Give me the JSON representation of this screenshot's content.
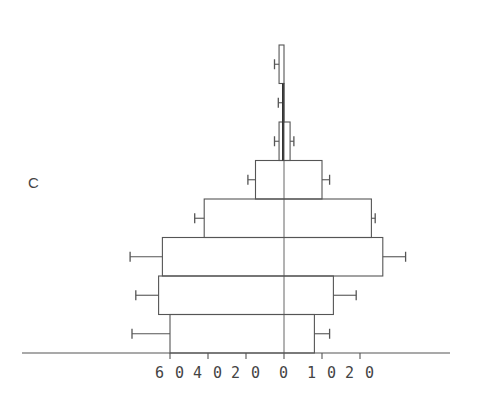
{
  "panel_label": "C",
  "chart_data": {
    "type": "bar",
    "orientation": "horizontal",
    "style": "population-pyramid",
    "title": "",
    "xlabel": "",
    "ylabel": "",
    "panel": "C",
    "grid": false,
    "legend": null,
    "left_axis": {
      "ticks": [
        60,
        40,
        20,
        0
      ],
      "tick_labels": [
        "60",
        "40",
        "20",
        "0"
      ],
      "range": [
        0,
        85
      ]
    },
    "right_axis": {
      "ticks": [
        0,
        10,
        20
      ],
      "tick_labels": [
        "0",
        "10",
        "20"
      ],
      "range": [
        0,
        40
      ]
    },
    "categories": [
      "1",
      "2",
      "3",
      "4",
      "5",
      "6",
      "7",
      "8"
    ],
    "category_order": "bottom-to-top",
    "series": [
      {
        "name": "left",
        "values": [
          60,
          66,
          64,
          42,
          15,
          2.6,
          0.5,
          2.6
        ],
        "error": [
          80,
          78,
          81,
          47,
          19,
          5,
          3,
          5
        ]
      },
      {
        "name": "right",
        "values": [
          8,
          13,
          26,
          23,
          10,
          1.6,
          0,
          0
        ],
        "error": [
          12,
          19,
          32,
          24,
          12,
          2.6,
          null,
          null
        ]
      }
    ]
  },
  "layout": {
    "center_x": 284,
    "baseline_y": 353,
    "bar_height": 38.5,
    "left_px_per_unit": 1.9,
    "right_px_per_unit": 3.8,
    "axis_x_start": 22,
    "axis_x_end": 450,
    "stroke_color": "#555555"
  }
}
